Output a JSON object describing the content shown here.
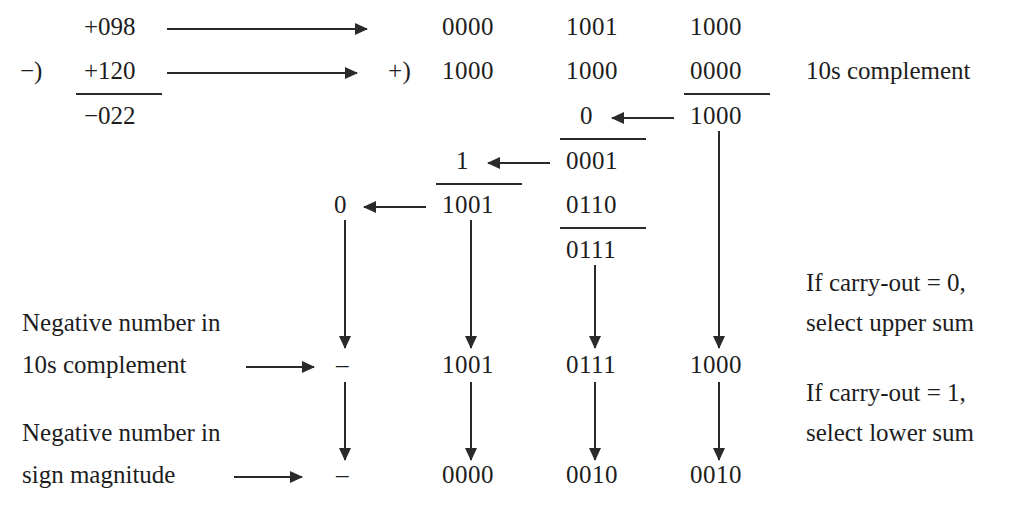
{
  "figure": {
    "ink_color": "#1d1d1d",
    "background_color": "#ffffff"
  },
  "decimal": {
    "minuend": "+098",
    "minus_sign": "−)",
    "subtrahend": "+120",
    "result": "−022"
  },
  "binary": {
    "plus_operator": "+)",
    "row1": [
      "0000",
      "1001",
      "1000"
    ],
    "row2": [
      "1000",
      "1000",
      "0000"
    ],
    "digit3_sum": "1000",
    "digit3_carry_to_digit2": "0",
    "digit2_upper_sum": "0001",
    "digit2_correction": "0110",
    "digit2_lower_sum": "0111",
    "digit2_carry_to_digit1": "1",
    "digit1_sum": "1001",
    "digit1_carry_out": "0"
  },
  "labels": {
    "tens_complement": "10s complement",
    "negative_10s_line1": "Negative number in",
    "negative_10s_line2": "10s complement",
    "negative_sm_line1": "Negative number in",
    "negative_sm_line2": "sign magnitude",
    "carry0_line1": "If carry-out = 0,",
    "carry0_line2": "select upper sum",
    "carry1_line1": "If carry-out = 1,",
    "carry1_line2": "select lower sum"
  },
  "results": {
    "tens_complement_row": {
      "sign": "–",
      "digits": [
        "1001",
        "0111",
        "1000"
      ]
    },
    "sign_magnitude_row": {
      "sign": "–",
      "digits": [
        "0000",
        "0010",
        "0010"
      ]
    }
  }
}
